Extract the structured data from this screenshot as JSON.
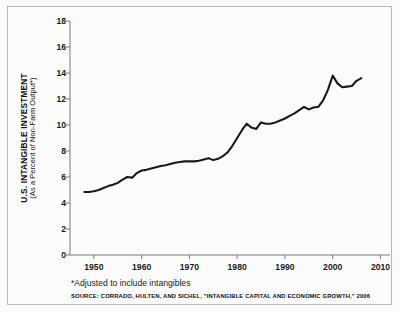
{
  "figure": {
    "background_color": "#fbfbfb",
    "frame_color": "#b9b9b9",
    "line_color": "#1a1a1a",
    "axis_color": "#7a7a7a"
  },
  "axis_titles": {
    "y_main": "U.S. INTANGIBLE INVESTMENT",
    "y_sub": "(As a Percent of Non-Farm Output*)"
  },
  "notes": {
    "footnote": "*Adjusted to include intangibles",
    "source": "SOURCE: CORRADO, HULTEN, AND SICHEL, \"INTANGIBLE CAPITAL AND ECONOMIC GROWTH,\" 2006"
  },
  "chart_data": {
    "type": "line",
    "title": "",
    "xlabel": "",
    "ylabel": "U.S. INTANGIBLE INVESTMENT (As a Percent of Non-Farm Output*)",
    "xlim": [
      1945,
      2012
    ],
    "ylim": [
      0,
      18
    ],
    "xticks": [
      1950,
      1960,
      1970,
      1980,
      1990,
      2000,
      2010
    ],
    "yticks": [
      0,
      2,
      4,
      6,
      8,
      10,
      12,
      14,
      16,
      18
    ],
    "grid": false,
    "legend": null,
    "series": [
      {
        "name": "U.S. Intangible Investment",
        "x": [
          1948,
          1949,
          1950,
          1951,
          1952,
          1953,
          1954,
          1955,
          1956,
          1957,
          1958,
          1959,
          1960,
          1961,
          1962,
          1963,
          1964,
          1965,
          1966,
          1967,
          1968,
          1969,
          1970,
          1971,
          1972,
          1973,
          1974,
          1975,
          1976,
          1977,
          1978,
          1979,
          1980,
          1981,
          1982,
          1983,
          1984,
          1985,
          1986,
          1987,
          1988,
          1989,
          1990,
          1991,
          1992,
          1993,
          1994,
          1995,
          1996,
          1997,
          1998,
          1999,
          2000,
          2001,
          2002,
          2003,
          2004,
          2005,
          2006
        ],
        "values": [
          4.85,
          4.85,
          4.9,
          5.0,
          5.15,
          5.3,
          5.4,
          5.55,
          5.8,
          6.0,
          5.95,
          6.3,
          6.5,
          6.55,
          6.65,
          6.75,
          6.85,
          6.9,
          7.0,
          7.1,
          7.15,
          7.2,
          7.2,
          7.2,
          7.25,
          7.35,
          7.45,
          7.3,
          7.4,
          7.6,
          7.9,
          8.4,
          9.0,
          9.6,
          10.1,
          9.8,
          9.7,
          10.2,
          10.1,
          10.1,
          10.2,
          10.35,
          10.5,
          10.7,
          10.9,
          11.15,
          11.4,
          11.2,
          11.35,
          11.4,
          11.9,
          12.7,
          13.8,
          13.2,
          12.9,
          12.95,
          13.0,
          13.4,
          13.6
        ]
      }
    ]
  }
}
